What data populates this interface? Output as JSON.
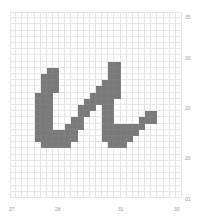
{
  "grid": {
    "cols": 28,
    "rows": 30,
    "fill_color": "#7a7a7a",
    "line_color": "#e6e6e6",
    "filled": [
      [
        9,
        6
      ],
      [
        9,
        7
      ],
      [
        10,
        5
      ],
      [
        10,
        6
      ],
      [
        10,
        7
      ],
      [
        11,
        5
      ],
      [
        11,
        6
      ],
      [
        11,
        7
      ],
      [
        12,
        5
      ],
      [
        12,
        6
      ],
      [
        12,
        7
      ],
      [
        13,
        4
      ],
      [
        13,
        5
      ],
      [
        13,
        6
      ],
      [
        14,
        4
      ],
      [
        14,
        5
      ],
      [
        14,
        6
      ],
      [
        15,
        4
      ],
      [
        15,
        5
      ],
      [
        15,
        6
      ],
      [
        16,
        4
      ],
      [
        16,
        5
      ],
      [
        16,
        6
      ],
      [
        17,
        4
      ],
      [
        17,
        5
      ],
      [
        17,
        6
      ],
      [
        17,
        10
      ],
      [
        17,
        11
      ],
      [
        18,
        4
      ],
      [
        18,
        5
      ],
      [
        18,
        6
      ],
      [
        18,
        9
      ],
      [
        18,
        10
      ],
      [
        18,
        11
      ],
      [
        19,
        4
      ],
      [
        19,
        5
      ],
      [
        19,
        6
      ],
      [
        19,
        7
      ],
      [
        19,
        8
      ],
      [
        19,
        9
      ],
      [
        19,
        10
      ],
      [
        20,
        4
      ],
      [
        20,
        5
      ],
      [
        20,
        6
      ],
      [
        20,
        7
      ],
      [
        20,
        8
      ],
      [
        20,
        9
      ],
      [
        20,
        10
      ],
      [
        21,
        5
      ],
      [
        21,
        6
      ],
      [
        21,
        7
      ],
      [
        21,
        8
      ],
      [
        21,
        9
      ],
      [
        8,
        16
      ],
      [
        8,
        17
      ],
      [
        9,
        16
      ],
      [
        9,
        17
      ],
      [
        10,
        16
      ],
      [
        10,
        17
      ],
      [
        11,
        15
      ],
      [
        11,
        16
      ],
      [
        11,
        17
      ],
      [
        12,
        14
      ],
      [
        12,
        15
      ],
      [
        12,
        16
      ],
      [
        12,
        17
      ],
      [
        13,
        13
      ],
      [
        13,
        14
      ],
      [
        13,
        15
      ],
      [
        13,
        16
      ],
      [
        13,
        17
      ],
      [
        14,
        12
      ],
      [
        14,
        13
      ],
      [
        14,
        14
      ],
      [
        14,
        15
      ],
      [
        14,
        16
      ],
      [
        15,
        11
      ],
      [
        15,
        12
      ],
      [
        15,
        13
      ],
      [
        15,
        15
      ],
      [
        15,
        16
      ],
      [
        16,
        11
      ],
      [
        16,
        12
      ],
      [
        16,
        15
      ],
      [
        16,
        16
      ],
      [
        16,
        22
      ],
      [
        16,
        23
      ],
      [
        17,
        15
      ],
      [
        17,
        16
      ],
      [
        17,
        21
      ],
      [
        17,
        22
      ],
      [
        17,
        23
      ],
      [
        18,
        15
      ],
      [
        18,
        16
      ],
      [
        18,
        17
      ],
      [
        18,
        18
      ],
      [
        18,
        19
      ],
      [
        18,
        20
      ],
      [
        18,
        21
      ],
      [
        19,
        15
      ],
      [
        19,
        16
      ],
      [
        19,
        17
      ],
      [
        19,
        18
      ],
      [
        19,
        19
      ],
      [
        19,
        20
      ],
      [
        20,
        15
      ],
      [
        20,
        16
      ],
      [
        20,
        17
      ],
      [
        20,
        18
      ],
      [
        20,
        19
      ],
      [
        21,
        16
      ],
      [
        21,
        17
      ],
      [
        21,
        18
      ]
    ]
  },
  "y_labels": [
    {
      "text": "35",
      "top": 14
    },
    {
      "text": "30",
      "top": 55
    },
    {
      "text": "20",
      "top": 105
    },
    {
      "text": "20",
      "top": 155
    },
    {
      "text": "01",
      "top": 196
    }
  ],
  "x_labels": [
    {
      "text": "27",
      "left": 9
    },
    {
      "text": "28",
      "left": 55
    },
    {
      "text": "31",
      "left": 118
    },
    {
      "text": "30",
      "left": 174
    }
  ]
}
